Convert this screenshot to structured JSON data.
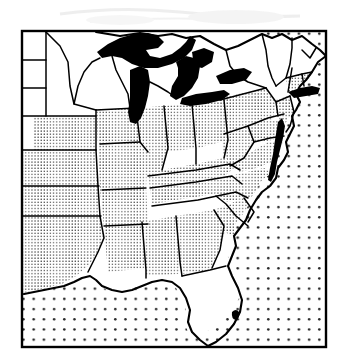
{
  "figure": {
    "kind": "thematic-choropleth-map",
    "title": "",
    "caption": "",
    "region_label": "Eastern United States",
    "rendering": "scanned line-art, 1-bit halftone",
    "frame": {
      "x": 21,
      "y": 30,
      "width": 306,
      "height": 318,
      "stroke": "#000000",
      "stroke_width": 2
    }
  },
  "colors": {
    "ink": "#000000",
    "paper": "#ffffff",
    "water_fill": "#000000",
    "land_shaded_dot": "#1a1a1a",
    "ocean_dot": "#222222",
    "scan_noise": "#cfcfcf"
  },
  "legend": {
    "visible": false,
    "classes": [
      {
        "key": "shaded",
        "pattern": "fine-stipple",
        "label": "Shaded states"
      },
      {
        "key": "unshaded",
        "pattern": "blank-white",
        "label": "Unshaded states"
      },
      {
        "key": "water",
        "pattern": "solid-black",
        "label": "Lakes and bays"
      },
      {
        "key": "ocean",
        "pattern": "coarse-dot-grid",
        "label": "Ocean / offshore"
      }
    ]
  },
  "patterns": {
    "land_stipple": {
      "spacing": 3.1,
      "dot_radius": 0.62
    },
    "ocean_dots": {
      "spacing": 10.2,
      "dot_radius": 1.25
    }
  },
  "water_features": [
    {
      "name": "Lake Superior",
      "fill": "solid-black"
    },
    {
      "name": "Lake Michigan",
      "fill": "solid-black"
    },
    {
      "name": "Lake Huron",
      "fill": "solid-black"
    },
    {
      "name": "Lake Erie",
      "fill": "solid-black"
    },
    {
      "name": "Lake Ontario",
      "fill": "solid-black"
    },
    {
      "name": "Chesapeake Bay",
      "fill": "solid-black"
    },
    {
      "name": "Lake Okeechobee",
      "fill": "solid-black"
    },
    {
      "name": "Long Island Sound",
      "fill": "solid-black"
    },
    {
      "name": "Atlantic Ocean",
      "fill": "coarse-dot-grid"
    },
    {
      "name": "Gulf of Mexico",
      "fill": "coarse-dot-grid"
    }
  ],
  "states": [
    {
      "name": "North Dakota",
      "shading": "unshaded"
    },
    {
      "name": "South Dakota",
      "shading": "unshaded"
    },
    {
      "name": "Nebraska",
      "shading": "unshaded"
    },
    {
      "name": "Minnesota",
      "shading": "unshaded"
    },
    {
      "name": "Wisconsin",
      "shading": "unshaded"
    },
    {
      "name": "Michigan",
      "shading": "unshaded"
    },
    {
      "name": "Maine",
      "shading": "unshaded"
    },
    {
      "name": "New Hampshire",
      "shading": "unshaded"
    },
    {
      "name": "Vermont",
      "shading": "unshaded"
    },
    {
      "name": "Massachusetts",
      "shading": "unshaded"
    },
    {
      "name": "New York",
      "shading": "unshaded"
    },
    {
      "name": "Louisiana",
      "shading": "unshaded"
    },
    {
      "name": "Florida",
      "shading": "unshaded"
    },
    {
      "name": "Kansas",
      "shading": "shaded"
    },
    {
      "name": "Oklahoma",
      "shading": "shaded"
    },
    {
      "name": "Texas",
      "shading": "shaded"
    },
    {
      "name": "Iowa",
      "shading": "shaded"
    },
    {
      "name": "Missouri",
      "shading": "shaded"
    },
    {
      "name": "Arkansas",
      "shading": "shaded"
    },
    {
      "name": "Illinois",
      "shading": "shaded"
    },
    {
      "name": "Indiana",
      "shading": "shaded"
    },
    {
      "name": "Ohio",
      "shading": "shaded"
    },
    {
      "name": "Kentucky",
      "shading": "shaded"
    },
    {
      "name": "Tennessee",
      "shading": "shaded"
    },
    {
      "name": "Mississippi",
      "shading": "shaded"
    },
    {
      "name": "Alabama",
      "shading": "shaded"
    },
    {
      "name": "Georgia",
      "shading": "shaded"
    },
    {
      "name": "South Carolina",
      "shading": "shaded"
    },
    {
      "name": "North Carolina",
      "shading": "shaded"
    },
    {
      "name": "Virginia",
      "shading": "shaded"
    },
    {
      "name": "West Virginia",
      "shading": "shaded"
    },
    {
      "name": "Pennsylvania",
      "shading": "shaded"
    },
    {
      "name": "Maryland",
      "shading": "shaded"
    },
    {
      "name": "Delaware",
      "shading": "shaded"
    },
    {
      "name": "New Jersey",
      "shading": "shaded"
    },
    {
      "name": "Connecticut",
      "shading": "shaded"
    },
    {
      "name": "Rhode Island",
      "shading": "shaded"
    }
  ]
}
